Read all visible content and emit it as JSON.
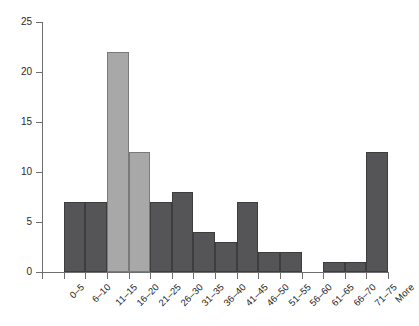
{
  "chart_data": {
    "type": "bar",
    "title": "",
    "subtitle": "",
    "xlabel": "",
    "ylabel": "",
    "categories": [
      "0–5",
      "6–10",
      "11–15",
      "16–20",
      "21–25",
      "26–30",
      "31–35",
      "36–40",
      "41–45",
      "46–50",
      "51–55",
      "56–60",
      "61–65",
      "66–70",
      "71–75",
      "More"
    ],
    "values": [
      0,
      7,
      7,
      22,
      12,
      7,
      8,
      4,
      3,
      7,
      2,
      2,
      0,
      1,
      1,
      12
    ],
    "bar_colors": [
      "#555558",
      "#555558",
      "#555558",
      "#a8a8a8",
      "#a8a8a8",
      "#555558",
      "#555558",
      "#555558",
      "#555558",
      "#555558",
      "#555558",
      "#555558",
      "#555558",
      "#555558",
      "#555558",
      "#555558"
    ],
    "highlighted_categories": [
      "16–20",
      "21–25"
    ],
    "ylim": [
      0,
      25
    ],
    "ytick_values": [
      0,
      5,
      10,
      15,
      20,
      25
    ],
    "ytick_labels": [
      "0",
      "5",
      "10",
      "15",
      "20",
      "25"
    ],
    "grid": false,
    "legend": null,
    "legend_position": "none",
    "xtick_label_rotation": 45,
    "axis_color": "#6e6e6e",
    "background_color": "#ffffff",
    "accent_color": "#a8a8a8",
    "base_color": "#555558"
  }
}
